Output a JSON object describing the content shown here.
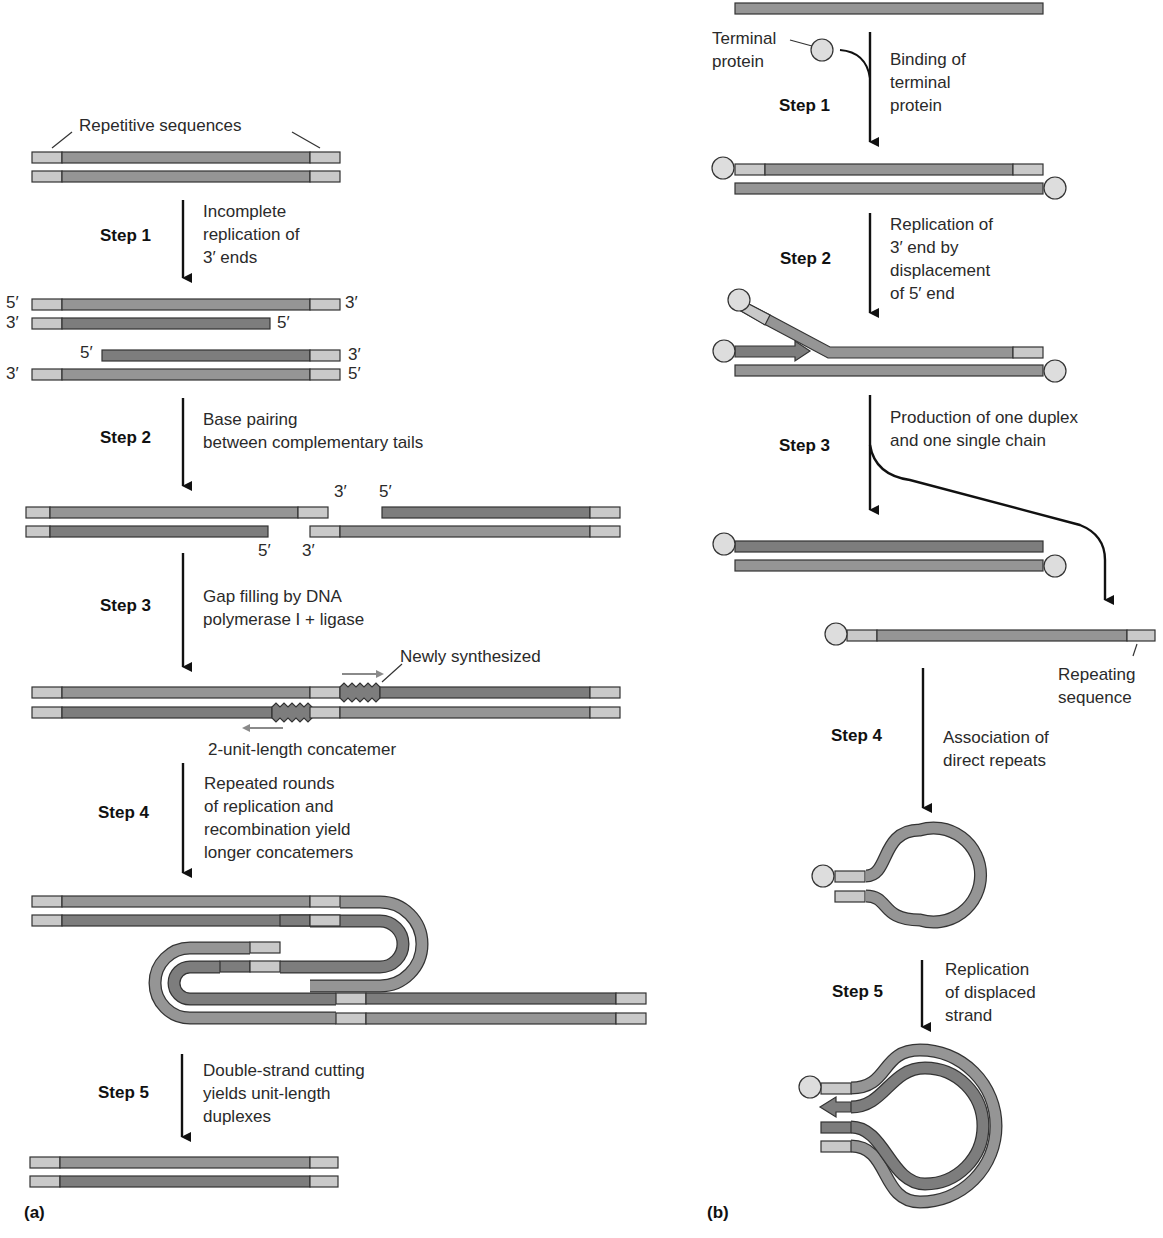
{
  "colors": {
    "light_seg": "#c9c9c9",
    "medium_strand": "#959595",
    "dark_strand": "#7d7d7d",
    "outline": "#333333",
    "arrow": "#111111",
    "gray_arrow": "#8a8a8a"
  },
  "panel_a": {
    "label": "(a)",
    "repetitive_sequences": "Repetitive sequences",
    "steps": [
      {
        "label": "Step 1",
        "text": "Incomplete\nreplication of\n3′ ends"
      },
      {
        "label": "Step 2",
        "text": "Base pairing\nbetween complementary tails"
      },
      {
        "label": "Step 3",
        "text": "Gap filling by DNA\npolymerase I + ligase"
      },
      {
        "label": "Step 4",
        "text": "Repeated rounds\nof replication and\nrecombination yield\nlonger concatemers"
      },
      {
        "label": "Step 5",
        "text": "Double-strand cutting\nyields unit-length\nduplexes"
      }
    ],
    "end_labels": {
      "five": "5′",
      "three": "3′"
    },
    "newly_synthesized": "Newly synthesized",
    "concatemer": "2-unit-length concatemer"
  },
  "panel_b": {
    "label": "(b)",
    "terminal_protein": "Terminal\nprotein",
    "repeating_sequence": "Repeating\nsequence",
    "steps": [
      {
        "label": "Step 1",
        "text": "Binding of\nterminal\nprotein"
      },
      {
        "label": "Step 2",
        "text": "Replication of\n3′ end by\ndisplacement\nof 5′ end"
      },
      {
        "label": "Step 3",
        "text": "Production of one duplex\nand one single chain"
      },
      {
        "label": "Step 4",
        "text": "Association of\ndirect repeats"
      },
      {
        "label": "Step 5",
        "text": "Replication\nof displaced\nstrand"
      }
    ]
  }
}
